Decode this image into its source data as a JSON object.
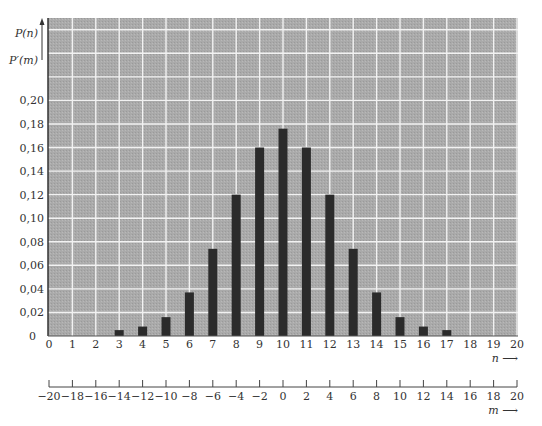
{
  "chart_data": {
    "type": "bar",
    "title": "",
    "xlabel": "n",
    "xlabel_secondary": "m",
    "ylabel": "P(n)",
    "ylabel_secondary": "P'(m)",
    "x": [
      0,
      1,
      2,
      3,
      4,
      5,
      6,
      7,
      8,
      9,
      10,
      11,
      12,
      13,
      14,
      15,
      16,
      17,
      18,
      19,
      20
    ],
    "values": [
      0,
      0,
      0,
      0.005,
      0.008,
      0.016,
      0.037,
      0.074,
      0.12,
      0.16,
      0.176,
      0.16,
      0.12,
      0.074,
      0.037,
      0.016,
      0.008,
      0.005,
      0,
      0,
      0
    ],
    "xlim": [
      0,
      20
    ],
    "ylim": [
      0,
      0.27
    ],
    "grid": true,
    "legend": null,
    "x_ticks": [
      "0",
      "1",
      "2",
      "3",
      "4",
      "5",
      "6",
      "7",
      "8",
      "9",
      "10",
      "11",
      "12",
      "13",
      "14",
      "15",
      "16",
      "17",
      "18",
      "19",
      "20"
    ],
    "y_ticks": [
      {
        "value": 0,
        "label": "0"
      },
      {
        "value": 0.02,
        "label": "0,02"
      },
      {
        "value": 0.04,
        "label": "0,04"
      },
      {
        "value": 0.06,
        "label": "0,06"
      },
      {
        "value": 0.08,
        "label": "0,08"
      },
      {
        "value": 0.1,
        "label": "0,10"
      },
      {
        "value": 0.12,
        "label": "0,12"
      },
      {
        "value": 0.14,
        "label": "0,14"
      },
      {
        "value": 0.16,
        "label": "0,16"
      },
      {
        "value": 0.18,
        "label": "0,18"
      },
      {
        "value": 0.2,
        "label": "0,20"
      }
    ],
    "secondary_x_axis": {
      "label": "m",
      "range": [
        -20,
        20
      ],
      "ticks": [
        "−20",
        "−18",
        "−16",
        "−14",
        "−12",
        "−10",
        "−8",
        "−6",
        "−4",
        "−2",
        "0",
        "2",
        "4",
        "6",
        "8",
        "10",
        "12",
        "14",
        "16",
        "18",
        "20"
      ]
    },
    "colors": {
      "plot_background": "#a9a9a9",
      "grid": "#f2f2f2",
      "bar": "#2b2b2b",
      "axis": "#333333"
    }
  },
  "labels": {
    "y_primary": "P(n)",
    "y_secondary": "P′(m)",
    "x_primary_arrow": "n ⟶",
    "x_secondary_arrow": "m ⟶"
  }
}
